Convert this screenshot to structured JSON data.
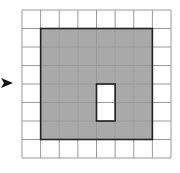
{
  "diagram": {
    "grid": {
      "rows": 8,
      "cols": 8
    },
    "shaded_region": {
      "row_start": 1,
      "row_end": 6,
      "col_start": 1,
      "col_end": 6
    },
    "hole_cells": [
      {
        "row": 4,
        "col": 4
      },
      {
        "row": 5,
        "col": 4
      }
    ],
    "arrow": {
      "direction": "right",
      "target_row": 4
    },
    "colors": {
      "background": "#ffffff",
      "shaded_fill": "#a9a9a9",
      "grid_line": "#9a9a9a",
      "border": "#222222",
      "arrow": "#111111"
    }
  }
}
